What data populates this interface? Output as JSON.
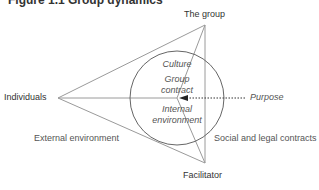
{
  "header": {
    "title_cut": "Figure 1.1 Group dynamics"
  },
  "vertices": {
    "top": "The group",
    "left": "Individuals",
    "bottom": "Facilitator"
  },
  "circle": {
    "culture": "Culture",
    "group_contract_line1": "Group",
    "group_contract_line2": "contract",
    "internal_env_line1": "Internal",
    "internal_env_line2": "environment"
  },
  "arrow_label": "Purpose",
  "outside": {
    "left": "External environment",
    "right": "Social and legal contracts"
  },
  "colors": {
    "line": "#8a8a8a",
    "circle": "#555555",
    "arrow": "#222222"
  }
}
